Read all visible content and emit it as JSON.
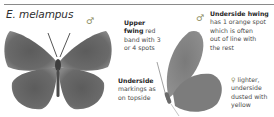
{
  "species": {
    "title": "E. melampus",
    "male_symbol": "♂",
    "female_symbol": "♀"
  },
  "annotations": {
    "upper_fwing": {
      "heading": "Upper fwing",
      "heading_line1": "Upper",
      "heading_line2": "fwing",
      "text_line2": " red",
      "text_line3": "band with 3",
      "text_line4": "or 4 spots"
    },
    "underside": {
      "heading": "Underside",
      "line2": "markings as",
      "line3": "on topside"
    },
    "underside_hwing": {
      "heading": "Underside hwing",
      "line2": "has 1 orange spot",
      "line3": "which is often",
      "line4": "out of line with",
      "line5": "the rest"
    },
    "female": {
      "line1": " lighter,",
      "line2": "underside",
      "line3": "dusted with",
      "line4": "yellow"
    }
  },
  "images": {
    "upperside": "male-upperside-butterfly",
    "underside": "male-underside-butterfly"
  },
  "colors": {
    "wing_dark": "#5a5a5a",
    "wing_mid": "#7a7a7a",
    "text": "#3a3a3a",
    "rule": "#8a8a8a"
  }
}
